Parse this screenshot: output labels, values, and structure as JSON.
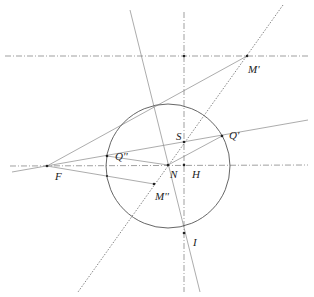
{
  "diagram": {
    "type": "geometric construction",
    "circle": {
      "center": [
        178,
        167
      ],
      "radius": 62,
      "stroke": "#555555"
    },
    "points": {
      "F": {
        "label": "F",
        "x": 47,
        "y": 166
      },
      "N": {
        "label": "N",
        "x": 168,
        "y": 165
      },
      "H": {
        "label": "H",
        "x": 184,
        "y": 165
      },
      "S": {
        "label": "S",
        "x": 184,
        "y": 142
      },
      "Q1": {
        "label": "Q'",
        "x": 222,
        "y": 136
      },
      "Q2": {
        "label": "Q''",
        "x": 107,
        "y": 156
      },
      "M1": {
        "label": "M'",
        "x": 247,
        "y": 56
      },
      "M2": {
        "label": "M''",
        "x": 154,
        "y": 184
      },
      "I": {
        "label": "I",
        "x": 184,
        "y": 232
      },
      "top": {
        "label": "",
        "x": 184,
        "y": 56
      }
    },
    "labels": [
      {
        "id": "label-M1",
        "text": "M'",
        "x": 248,
        "y": 64
      },
      {
        "id": "label-S",
        "text": "S",
        "x": 176,
        "y": 131
      },
      {
        "id": "label-Q1",
        "text": "Q'",
        "x": 231,
        "y": 130
      },
      {
        "id": "label-Q2",
        "text": "Q''",
        "x": 115,
        "y": 151
      },
      {
        "id": "label-F",
        "text": "F",
        "x": 54,
        "y": 171
      },
      {
        "id": "label-N",
        "text": "N",
        "x": 171,
        "y": 169
      },
      {
        "id": "label-H",
        "text": "H",
        "x": 192,
        "y": 169
      },
      {
        "id": "label-M2",
        "text": "M''",
        "x": 155,
        "y": 190
      },
      {
        "id": "label-I",
        "text": "I",
        "x": 191,
        "y": 237
      }
    ]
  }
}
